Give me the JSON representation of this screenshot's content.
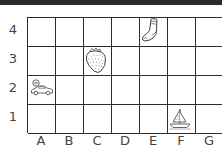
{
  "grid": {
    "columns": [
      "A",
      "B",
      "C",
      "D",
      "E",
      "F",
      "G"
    ],
    "rows": [
      "4",
      "3",
      "2",
      "1"
    ],
    "line_color": "#2b2b2b"
  },
  "x_labels": [
    "A",
    "B",
    "C",
    "D",
    "E",
    "F",
    "G"
  ],
  "y_labels": [
    "4",
    "3",
    "2",
    "1"
  ],
  "items": [
    {
      "name": "car",
      "cell": "A2",
      "icon": "car-icon"
    },
    {
      "name": "strawberry",
      "cell": "C3",
      "icon": "strawberry-icon"
    },
    {
      "name": "sock",
      "cell": "E4",
      "icon": "sock-icon"
    },
    {
      "name": "sailboat",
      "cell": "F1",
      "icon": "sailboat-icon"
    }
  ]
}
